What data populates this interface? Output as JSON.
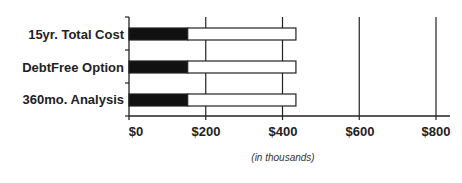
{
  "chart_data": {
    "type": "bar",
    "orientation": "horizontal",
    "stacked": true,
    "title": "",
    "xlabel": "(in thousands)",
    "ylabel": "",
    "categories": [
      "15yr.  Total Cost",
      "DebtFree Option",
      "360mo. Analysis"
    ],
    "series": [
      {
        "name": "Principal",
        "color": "#111111",
        "values": [
          153,
          153,
          153
        ]
      },
      {
        "name": "Remainder",
        "color": "#ffffff",
        "values": [
          282,
          282,
          282
        ]
      }
    ],
    "totals": [
      435,
      435,
      435
    ],
    "xlim": [
      0,
      800
    ],
    "xticks": [
      0,
      200,
      400,
      600,
      800
    ],
    "xtick_labels": [
      "$0",
      "$200",
      "$400",
      "$600",
      "$800"
    ],
    "grid": "vertical",
    "legend": "none"
  },
  "labels": {
    "categories": [
      "15yr.  Total Cost",
      "DebtFree Option",
      "360mo. Analysis"
    ],
    "ticks": [
      "$0",
      "$200",
      "$400",
      "$600",
      "$800"
    ],
    "axis_note": "(in thousands)"
  }
}
